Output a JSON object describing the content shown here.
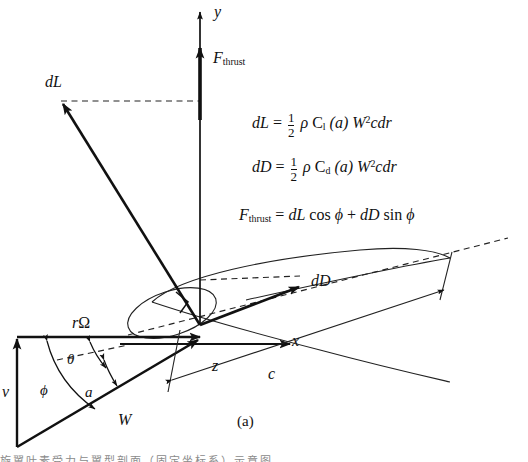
{
  "figure": {
    "caption": "(a)",
    "bottom_cropped_text": "旋翼叶素受力与翼型剖面（固定坐标系）示意图",
    "colors": {
      "ink": "#111111",
      "thin": "#3a3a3a",
      "dash": "#222222",
      "paper": "#ffffff"
    }
  },
  "axes": [
    {
      "name": "y-axis",
      "label": "y"
    },
    {
      "name": "x-axis",
      "label": "x"
    },
    {
      "name": "z-axis",
      "label": "z"
    }
  ],
  "vectors": [
    {
      "name": "thrust",
      "label": "F",
      "sublabel": "thrust"
    },
    {
      "name": "lift",
      "label": "dL"
    },
    {
      "name": "drag",
      "label": "dD"
    },
    {
      "name": "axial-velocity",
      "label": "v"
    },
    {
      "name": "tangential-velocity",
      "label": "rΩ"
    },
    {
      "name": "resultant-velocity",
      "label": "W"
    }
  ],
  "angles": [
    {
      "name": "pitch-angle",
      "label": "θ"
    },
    {
      "name": "inflow-angle",
      "label": "ϕ"
    },
    {
      "name": "attack-angle",
      "label": "a"
    }
  ],
  "chord": {
    "name": "chord-length",
    "label": "c"
  },
  "equations": [
    {
      "id": "lift-equation",
      "lhs": "dL",
      "eq": "=",
      "frac_num": "1",
      "frac_den": "2",
      "rho": "ρ",
      "coef": "C",
      "coef_sub": "l",
      "arg": "(a)",
      "w": "W",
      "w_pow": "2",
      "tail": "cdr"
    },
    {
      "id": "drag-equation",
      "lhs": "dD",
      "eq": "=",
      "frac_num": "1",
      "frac_den": "2",
      "rho": "ρ",
      "coef": "C",
      "coef_sub": "d",
      "arg": "(a)",
      "w": "W",
      "w_pow": "2",
      "tail": "cdr"
    },
    {
      "id": "thrust-equation",
      "lhs": "F",
      "lhs_sub": "thrust",
      "eq": "=",
      "term1": "dL",
      "fn1": "cos",
      "ang1": "ϕ",
      "plus": "+",
      "term2": "dD",
      "fn2": "sin",
      "ang2": "ϕ"
    }
  ]
}
